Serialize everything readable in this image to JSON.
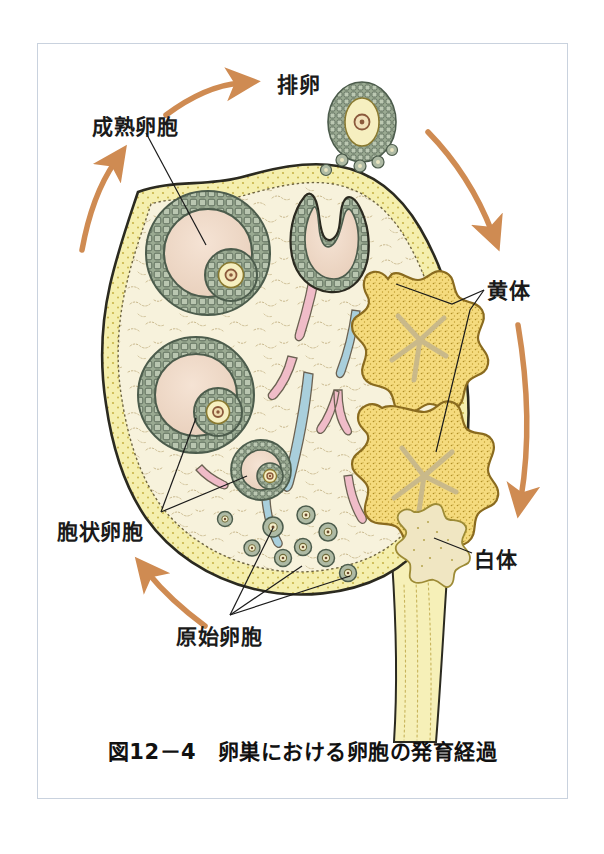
{
  "figure": {
    "caption": "図12－4　卵巣における卵胞の発育経過",
    "caption_number": "図12－4",
    "caption_title": "卵巣における卵胞の発育経過"
  },
  "labels": {
    "ovulation": "排卵",
    "mature_follicle": "成熟卵胞",
    "corpus_luteum": "黄体",
    "corpus_albicans": "白体",
    "antral_follicle": "胞状卵胞",
    "primordial_follicle": "原始卵胞"
  },
  "colors": {
    "arrow": "#cf8b52",
    "ovary_stroma": "#f7f2dc",
    "ovary_cortex_band": "#f5efae",
    "ovary_outline": "#2b2a20",
    "granulosa_cell": "#9aaa92",
    "granulosa_outline": "#4c5c4c",
    "antrum": "#efd9c8",
    "oocyte_cytoplasm": "#f6efc0",
    "oocyte_nucleus": "#8b5a3c",
    "corpus_luteum": "#f4d97a",
    "corpus_luteum_outline": "#8a6b1f",
    "corpus_albicans": "#f0e6c2",
    "vessel_pink": "#f0bcc8",
    "vessel_blue": "#a9cfdc",
    "stalk": "#f6f0b8",
    "frame_border": "#c9d2de",
    "page_background": "#ffffff",
    "text": "#1a1a1a"
  },
  "diagram": {
    "type": "anatomical-illustration",
    "structures": [
      {
        "name": "mature-follicle-upper-left",
        "kind": "graafian-follicle"
      },
      {
        "name": "mature-follicle-lower-left",
        "kind": "graafian-follicle"
      },
      {
        "name": "secondary-follicle",
        "kind": "secondary-follicle"
      },
      {
        "name": "ruptured-follicle",
        "kind": "ruptured-follicle"
      },
      {
        "name": "released-oocyte",
        "kind": "ovulated-oocyte-with-corona-radiata"
      },
      {
        "name": "corpus-luteum-upper",
        "kind": "corpus-luteum"
      },
      {
        "name": "corpus-luteum-lower",
        "kind": "corpus-luteum"
      },
      {
        "name": "corpus-albicans",
        "kind": "corpus-albicans"
      },
      {
        "name": "primordial-follicles",
        "kind": "primordial-follicle-cluster",
        "count": 9
      },
      {
        "name": "ovarian-stroma",
        "kind": "stroma-with-vessels"
      },
      {
        "name": "ovarian-hilum-stalk",
        "kind": "mesovarium"
      }
    ],
    "cycle_arrows": [
      {
        "name": "arrow-top-left-to-ovulation",
        "direction": "right"
      },
      {
        "name": "arrow-left-upward",
        "direction": "up"
      },
      {
        "name": "arrow-right-from-ovulation",
        "direction": "down-right"
      },
      {
        "name": "arrow-right-downward",
        "direction": "down"
      },
      {
        "name": "arrow-bottom-left-upward",
        "direction": "up-left"
      }
    ]
  }
}
